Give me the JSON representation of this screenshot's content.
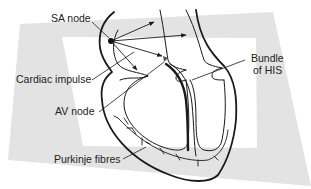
{
  "diagram": {
    "labels": {
      "sa_node": "SA node",
      "cardiac_impulse": "Cardiac impulse",
      "av_node": "AV node",
      "purkinje_fibres": "Purkinje fibres",
      "bundle_of_his_line1": "Bundle",
      "bundle_of_his_line2": "of HIS"
    },
    "colors": {
      "frame": "#e3e3e3",
      "line": "#1a1a1a",
      "text": "#222222"
    }
  }
}
